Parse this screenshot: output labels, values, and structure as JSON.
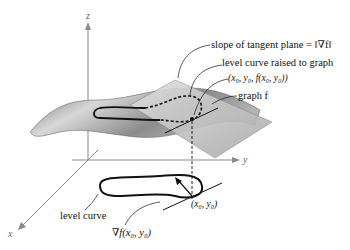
{
  "diagram": {
    "axes": {
      "x": "x",
      "y": "y",
      "z": "z"
    },
    "labels": {
      "slope": "slope of tangent plane = ‖∇f‖",
      "level_raised": "level curve raised to graph",
      "point3d": "(x₀, y₀, f(x₀, y₀))",
      "graph": "graph f",
      "level_curve": "level curve",
      "gradient": "∇f(x₀, y₀)",
      "point2d": "(x₀, y₀)"
    },
    "colors": {
      "surface": "#9a9a9a",
      "plane": "#c8c8c8",
      "axis": "#8a8a8a",
      "curve": "#111111"
    }
  }
}
